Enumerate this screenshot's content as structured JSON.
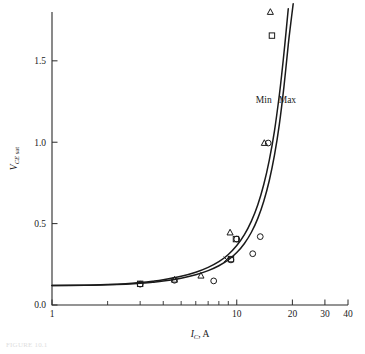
{
  "figure": {
    "caption": "FIGURE 10.1",
    "background": "#ffffff",
    "ink_color": "#1a1a1a"
  },
  "chart_data": {
    "type": "line",
    "title": "",
    "subtitle": "",
    "xlabel": "I_C, A",
    "xlabel_parts": {
      "symbol": "I",
      "subscript": "C",
      "unit": "A",
      "separator": ", "
    },
    "ylabel": "V_CE sat",
    "ylabel_parts": {
      "symbol": "V",
      "subscript": "CE",
      "suffix": "sat"
    },
    "xscale": "log",
    "yscale": "linear",
    "xlim": [
      1,
      40
    ],
    "ylim": [
      0.0,
      1.8
    ],
    "grid": false,
    "legend_position": "inline-on-curves",
    "xticks_major": [
      1,
      10,
      20,
      30,
      40
    ],
    "xtick_labels": [
      "1",
      "10",
      "20",
      "30",
      "40"
    ],
    "xticks_minor": [
      2,
      3,
      4,
      5,
      6,
      7,
      8,
      9
    ],
    "yticks": [
      0.0,
      0.5,
      1.0,
      1.5
    ],
    "ytick_labels": [
      "0.0",
      "0.5",
      "1.0",
      "1.5"
    ],
    "series": [
      {
        "name": "Min",
        "label": "Min",
        "label_x": 14.0,
        "label_y": 1.24,
        "style": "solid-curve",
        "x": [
          1.0,
          1.5,
          2.0,
          2.5,
          3.0,
          3.5,
          4.0,
          5.0,
          6.0,
          7.0,
          8.0,
          9.0,
          10.0,
          11.0,
          12.0,
          13.0,
          14.0,
          15.0,
          16.0,
          17.0,
          17.6,
          18.2,
          18.6,
          19.0
        ],
        "values": [
          0.12,
          0.122,
          0.126,
          0.131,
          0.138,
          0.146,
          0.155,
          0.176,
          0.201,
          0.231,
          0.266,
          0.31,
          0.365,
          0.432,
          0.515,
          0.616,
          0.74,
          0.89,
          1.07,
          1.29,
          1.44,
          1.6,
          1.71,
          1.82
        ]
      },
      {
        "name": "Max",
        "label": "Max",
        "label_x": 18.8,
        "label_y": 1.24,
        "style": "solid-curve",
        "x": [
          1.0,
          1.5,
          2.0,
          2.5,
          3.0,
          3.5,
          4.0,
          5.0,
          6.0,
          7.0,
          8.0,
          9.0,
          10.0,
          11.0,
          12.0,
          13.0,
          14.0,
          15.0,
          16.0,
          17.0,
          18.0,
          19.0,
          19.6,
          20.2
        ],
        "values": [
          0.12,
          0.121,
          0.124,
          0.128,
          0.133,
          0.14,
          0.147,
          0.165,
          0.186,
          0.211,
          0.241,
          0.277,
          0.322,
          0.378,
          0.447,
          0.532,
          0.637,
          0.765,
          0.92,
          1.11,
          1.34,
          1.6,
          1.73,
          1.85
        ]
      }
    ],
    "scatter_sets": [
      {
        "name": "circle-measurements",
        "marker": "circle",
        "points": [
          {
            "x": 3.0,
            "y": 0.128
          },
          {
            "x": 4.6,
            "y": 0.152
          },
          {
            "x": 7.5,
            "y": 0.148
          },
          {
            "x": 9.3,
            "y": 0.277
          },
          {
            "x": 10.0,
            "y": 0.405
          },
          {
            "x": 12.2,
            "y": 0.315
          },
          {
            "x": 13.4,
            "y": 0.42
          },
          {
            "x": 14.8,
            "y": 0.995
          }
        ]
      },
      {
        "name": "square-measurements",
        "marker": "square",
        "points": [
          {
            "x": 3.0,
            "y": 0.13
          },
          {
            "x": 9.3,
            "y": 0.282
          },
          {
            "x": 9.9,
            "y": 0.405
          },
          {
            "x": 15.5,
            "y": 1.655
          }
        ]
      },
      {
        "name": "triangle-measurements",
        "marker": "triangle",
        "points": [
          {
            "x": 4.6,
            "y": 0.155
          },
          {
            "x": 6.4,
            "y": 0.18
          },
          {
            "x": 9.2,
            "y": 0.445
          },
          {
            "x": 14.1,
            "y": 0.995
          },
          {
            "x": 15.2,
            "y": 1.8
          }
        ]
      },
      {
        "name": "cross-measurements",
        "marker": "x",
        "points": [
          {
            "x": 8.8,
            "y": 0.28
          }
        ]
      }
    ]
  }
}
